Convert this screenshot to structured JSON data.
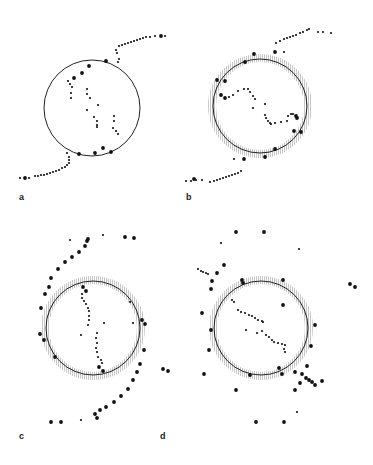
{
  "figure": {
    "panels": [
      {
        "label": "a",
        "label_pos": [
          19,
          200
        ],
        "circle": {
          "cx": 92,
          "cy": 108,
          "r": 48,
          "halo": false
        },
        "big_dots": [
          [
            161,
            36
          ],
          [
            106,
            61
          ],
          [
            89,
            66
          ],
          [
            82,
            73
          ],
          [
            74,
            78
          ],
          [
            111,
            152
          ],
          [
            103,
            148
          ],
          [
            95,
            153
          ],
          [
            79,
            154
          ],
          [
            25,
            178
          ]
        ],
        "small_dots": [
          [
            20,
            178
          ],
          [
            29,
            178
          ],
          [
            35,
            176
          ],
          [
            38,
            176
          ],
          [
            41,
            175
          ],
          [
            44,
            175
          ],
          [
            47,
            174
          ],
          [
            50,
            173
          ],
          [
            53,
            172
          ],
          [
            56,
            171
          ],
          [
            59,
            170
          ],
          [
            62,
            168
          ],
          [
            65,
            167
          ],
          [
            67,
            165
          ],
          [
            69,
            163
          ],
          [
            69,
            160
          ],
          [
            69,
            157
          ],
          [
            67,
            153
          ],
          [
            116,
            50
          ],
          [
            117,
            53
          ],
          [
            119,
            46
          ],
          [
            122,
            45
          ],
          [
            125,
            44
          ],
          [
            128,
            43
          ],
          [
            131,
            42
          ],
          [
            134,
            41
          ],
          [
            137,
            40
          ],
          [
            140,
            39
          ],
          [
            143,
            38
          ],
          [
            146,
            37
          ],
          [
            150,
            37
          ],
          [
            155,
            36
          ],
          [
            165,
            36
          ],
          [
            119,
            59
          ],
          [
            118,
            62
          ],
          [
            68,
            81
          ],
          [
            70,
            84
          ],
          [
            72,
            87
          ],
          [
            71,
            93
          ],
          [
            71,
            98
          ],
          [
            87,
            89
          ],
          [
            87,
            94
          ],
          [
            90,
            98
          ],
          [
            98,
            105
          ],
          [
            87,
            110
          ],
          [
            94,
            117
          ],
          [
            97,
            121
          ],
          [
            97,
            125
          ],
          [
            97,
            127
          ],
          [
            114,
            116
          ],
          [
            114,
            121
          ],
          [
            113,
            128
          ],
          [
            116,
            131
          ],
          [
            118,
            134
          ]
        ]
      },
      {
        "label": "b",
        "label_pos": [
          186,
          200
        ],
        "circle": {
          "cx": 260,
          "cy": 106,
          "r": 47,
          "halo": true
        },
        "big_dots": [
          [
            254,
            54
          ],
          [
            245,
            62
          ],
          [
            275,
            52
          ],
          [
            217,
            80
          ],
          [
            225,
            81
          ],
          [
            221,
            95
          ],
          [
            225,
            98
          ],
          [
            296,
            116
          ],
          [
            297,
            118
          ],
          [
            294,
            131
          ],
          [
            301,
            132
          ],
          [
            275,
            149
          ],
          [
            265,
            157
          ],
          [
            244,
            159
          ],
          [
            194,
            179
          ]
        ],
        "small_dots": [
          [
            276,
            43
          ],
          [
            280,
            41
          ],
          [
            284,
            39
          ],
          [
            287,
            38
          ],
          [
            290,
            37
          ],
          [
            293,
            36
          ],
          [
            296,
            35
          ],
          [
            300,
            33
          ],
          [
            303,
            32
          ],
          [
            307,
            30
          ],
          [
            309,
            29
          ],
          [
            318,
            32
          ],
          [
            323,
            32
          ],
          [
            331,
            33
          ],
          [
            284,
            52
          ],
          [
            234,
            159
          ],
          [
            186,
            181
          ],
          [
            191,
            181
          ],
          [
            196,
            180
          ],
          [
            202,
            180
          ],
          [
            210,
            182
          ],
          [
            214,
            181
          ],
          [
            217,
            180
          ],
          [
            220,
            179
          ],
          [
            223,
            178
          ],
          [
            226,
            177
          ],
          [
            229,
            176
          ],
          [
            232,
            175
          ],
          [
            235,
            174
          ],
          [
            238,
            173
          ],
          [
            241,
            171
          ],
          [
            229,
            97
          ],
          [
            233,
            95
          ],
          [
            238,
            91
          ],
          [
            244,
            89
          ],
          [
            248,
            89
          ],
          [
            250,
            92
          ],
          [
            253,
            96
          ],
          [
            255,
            99
          ],
          [
            253,
            108
          ],
          [
            265,
            104
          ],
          [
            265,
            115
          ],
          [
            266,
            118
          ],
          [
            268,
            121
          ],
          [
            270,
            123
          ],
          [
            271,
            124
          ],
          [
            275,
            123
          ],
          [
            281,
            122
          ],
          [
            287,
            121
          ],
          [
            288,
            116
          ],
          [
            291,
            114
          ],
          [
            293,
            114
          ]
        ]
      },
      {
        "label": "c",
        "label_pos": [
          19,
          439
        ],
        "circle": {
          "cx": 93,
          "cy": 328,
          "r": 47,
          "halo": true
        },
        "big_dots": [
          [
            88,
            239
          ],
          [
            87,
            241
          ],
          [
            85,
            246
          ],
          [
            79,
            252
          ],
          [
            72,
            257
          ],
          [
            65,
            262
          ],
          [
            58,
            269
          ],
          [
            51,
            278
          ],
          [
            49,
            287
          ],
          [
            45,
            294
          ],
          [
            41,
            308
          ],
          [
            40,
            334
          ],
          [
            44,
            340
          ],
          [
            55,
            357
          ],
          [
            83,
            287
          ],
          [
            86,
            291
          ],
          [
            142,
            320
          ],
          [
            145,
            324
          ],
          [
            144,
            350
          ],
          [
            140,
            364
          ],
          [
            137,
            372
          ],
          [
            133,
            380
          ],
          [
            128,
            389
          ],
          [
            121,
            396
          ],
          [
            114,
            402
          ],
          [
            106,
            407
          ],
          [
            100,
            410
          ],
          [
            95,
            414
          ],
          [
            97,
            418
          ],
          [
            99,
            367
          ],
          [
            103,
            371
          ],
          [
            125,
            237
          ],
          [
            134,
            238
          ],
          [
            51,
            422
          ],
          [
            61,
            422
          ],
          [
            163,
            369
          ],
          [
            168,
            371
          ]
        ],
        "small_dots": [
          [
            70,
            240
          ],
          [
            103,
            235
          ],
          [
            81,
            420
          ],
          [
            82,
            294
          ],
          [
            82,
            298
          ],
          [
            84,
            301
          ],
          [
            86,
            304
          ],
          [
            88,
            308
          ],
          [
            89,
            311
          ],
          [
            89,
            316
          ],
          [
            89,
            320
          ],
          [
            88,
            325
          ],
          [
            104,
            323
          ],
          [
            81,
            335
          ],
          [
            97,
            333
          ],
          [
            96,
            338
          ],
          [
            97,
            343
          ],
          [
            96,
            348
          ],
          [
            97,
            352
          ],
          [
            98,
            357
          ],
          [
            101,
            360
          ],
          [
            102,
            363
          ],
          [
            130,
            302
          ],
          [
            133,
            323
          ]
        ]
      },
      {
        "label": "d",
        "label_pos": [
          160,
          439
        ],
        "circle": {
          "cx": 261,
          "cy": 328,
          "r": 47,
          "halo": true
        },
        "big_dots": [
          [
            236,
            232
          ],
          [
            264,
            232
          ],
          [
            224,
            265
          ],
          [
            217,
            273
          ],
          [
            212,
            281
          ],
          [
            211,
            289
          ],
          [
            202,
            313
          ],
          [
            211,
            330
          ],
          [
            209,
            350
          ],
          [
            242,
            280
          ],
          [
            243,
            283
          ],
          [
            283,
            280
          ],
          [
            283,
            305
          ],
          [
            315,
            325
          ],
          [
            311,
            346
          ],
          [
            307,
            366
          ],
          [
            302,
            374
          ],
          [
            306,
            378
          ],
          [
            309,
            380
          ],
          [
            312,
            382
          ],
          [
            315,
            385
          ],
          [
            322,
            381
          ],
          [
            300,
            383
          ],
          [
            295,
            390
          ],
          [
            295,
            372
          ],
          [
            279,
            368
          ],
          [
            282,
            374
          ],
          [
            204,
            374
          ],
          [
            256,
            422
          ],
          [
            284,
            422
          ],
          [
            350,
            284
          ],
          [
            355,
            287
          ],
          [
            236,
            390
          ],
          [
            250,
            375
          ]
        ],
        "small_dots": [
          [
            221,
            243
          ],
          [
            299,
            249
          ],
          [
            198,
            269
          ],
          [
            201,
            271
          ],
          [
            203,
            272
          ],
          [
            206,
            273
          ],
          [
            208,
            274
          ],
          [
            232,
            300
          ],
          [
            234,
            302
          ],
          [
            238,
            310
          ],
          [
            241,
            312
          ],
          [
            245,
            313
          ],
          [
            249,
            315
          ],
          [
            252,
            316
          ],
          [
            255,
            318
          ],
          [
            258,
            320
          ],
          [
            262,
            321
          ],
          [
            263,
            322
          ],
          [
            262,
            331
          ],
          [
            257,
            333
          ],
          [
            266,
            335
          ],
          [
            269,
            337
          ],
          [
            272,
            340
          ],
          [
            274,
            342
          ],
          [
            278,
            343
          ],
          [
            282,
            344
          ],
          [
            285,
            345
          ],
          [
            284,
            349
          ],
          [
            285,
            352
          ],
          [
            246,
            330
          ],
          [
            297,
            412
          ]
        ]
      }
    ]
  }
}
